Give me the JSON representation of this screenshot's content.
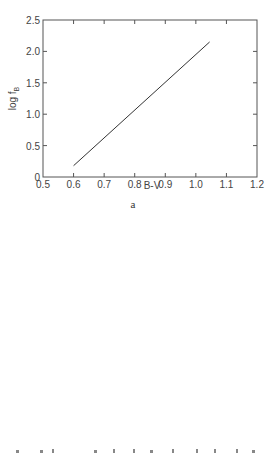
{
  "chart_data": [
    {
      "type": "scatter",
      "panel_label": "a",
      "title": "",
      "xlabel": "B-V",
      "ylabel": "log f_B",
      "ylabel_main": "log f",
      "ylabel_sub": "B",
      "xlim": [
        0.5,
        1.2
      ],
      "ylim": [
        0,
        2.5
      ],
      "xticks": [
        "0.5",
        "0.6",
        "0.7",
        "0.8",
        "0.9",
        "1.0",
        "1.1",
        "1.2"
      ],
      "yticks": [
        "0",
        "0.5",
        "1.0",
        "1.5",
        "2.0",
        "2.5"
      ],
      "grid": false,
      "legend_position": "upper left",
      "legend": [
        {
          "label": "Nucleus",
          "marker": "filled-circle"
        },
        {
          "label": "Bulge",
          "marker": "plus"
        },
        {
          "label": "Halo",
          "marker": "open-circle"
        }
      ],
      "series": [
        {
          "name": "Nucleus",
          "x": [
            0.88,
            0.89,
            1.03
          ],
          "y": [
            0.75,
            1.68,
            2.03
          ]
        },
        {
          "name": "Bulge",
          "x": [
            0.82,
            0.85,
            0.84,
            0.88
          ],
          "y": [
            1.06,
            1.16,
            0.68,
            1.48
          ]
        },
        {
          "name": "Halo",
          "x": [
            0.65
          ],
          "y": [
            0.5
          ]
        }
      ],
      "fit_line": {
        "style": "solid",
        "x": [
          0.6,
          1.045
        ],
        "y": [
          0.18,
          2.15
        ]
      }
    },
    {
      "type": "scatter",
      "panel_label": "b",
      "title": "",
      "xlabel": "U-B",
      "ylabel": "log f_B",
      "ylabel_main": "log f",
      "ylabel_sub": "B",
      "xlim": [
        0,
        0.74
      ],
      "ylim": [
        0,
        2.5
      ],
      "xticks": [
        "0",
        "0.1",
        "0.2",
        "0.3",
        "0.4",
        "0.5",
        "0.6",
        "0.7"
      ],
      "yticks": [
        "0",
        "0.5",
        "1.0",
        "1.5",
        "2.0",
        "2.5"
      ],
      "grid": false,
      "legend_position": "upper left",
      "legend": [
        {
          "label": "Nucleus",
          "marker": "filled-circle"
        },
        {
          "label": "Bulge",
          "marker": "plus"
        },
        {
          "label": "Halo",
          "marker": "open-circle"
        }
      ],
      "series": [
        {
          "name": "Nucleus",
          "x": [
            0.01,
            0.38,
            0.65,
            0.67,
            0.71
          ],
          "y": [
            0.5,
            0.74,
            1.67,
            1.67,
            2.03
          ]
        },
        {
          "name": "Bulge",
          "x": [
            0.34,
            0.43,
            0.47,
            0.58
          ],
          "y": [
            0.68,
            1.05,
            1.14,
            1.48
          ]
        },
        {
          "name": "Halo",
          "x": [
            0.74
          ],
          "y": [
            2.03
          ]
        }
      ],
      "fit_curve_dashed": {
        "style": "dashed",
        "x": [
          0.0,
          0.1,
          0.2,
          0.3,
          0.4,
          0.47
        ],
        "y": [
          0.37,
          0.45,
          0.57,
          0.75,
          0.97,
          1.13
        ]
      },
      "fit_curve_solid": {
        "style": "solid",
        "x": [
          0.47,
          0.58,
          0.74
        ],
        "y": [
          1.13,
          1.48,
          2.05
        ]
      }
    }
  ],
  "colors": {
    "ink": "#333333",
    "axis": "#555555",
    "background": "#ffffff"
  }
}
